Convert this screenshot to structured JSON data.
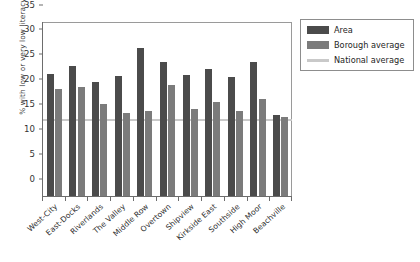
{
  "chart_data": {
    "type": "bar",
    "title": "",
    "xlabel": "",
    "ylabel": "% with low or very low literacy",
    "ylim": [
      0,
      35
    ],
    "yticks": [
      0,
      5,
      10,
      15,
      20,
      25,
      30,
      35
    ],
    "grid": false,
    "legend_position": "right",
    "categories": [
      "West-City",
      "East-Docks",
      "Riverlands",
      "The Valley",
      "Middle Row",
      "Overtown",
      "Shipview",
      "Kirkside East",
      "Southside",
      "High Moor",
      "Beachville"
    ],
    "series": [
      {
        "name": "Area",
        "color": "#4b4b4b",
        "values": [
          24.5,
          26.2,
          23.0,
          24.1,
          29.8,
          27.0,
          24.3,
          25.5,
          23.9,
          27.0,
          16.2
        ]
      },
      {
        "name": "Borough average",
        "color": "#7b7b7b",
        "values": [
          21.6,
          21.9,
          18.5,
          16.6,
          17.2,
          22.3,
          17.6,
          18.9,
          17.1,
          19.5,
          15.8
        ]
      }
    ],
    "reference_lines": [
      {
        "name": "National average",
        "color": "#c9c9c9",
        "value": 15
      }
    ]
  },
  "legend": {
    "items": [
      {
        "label": "Area",
        "swatch": "area-swatch"
      },
      {
        "label": "Borough average",
        "swatch": "borough-swatch"
      },
      {
        "label": "National average",
        "swatch": "national-swatch"
      }
    ]
  }
}
